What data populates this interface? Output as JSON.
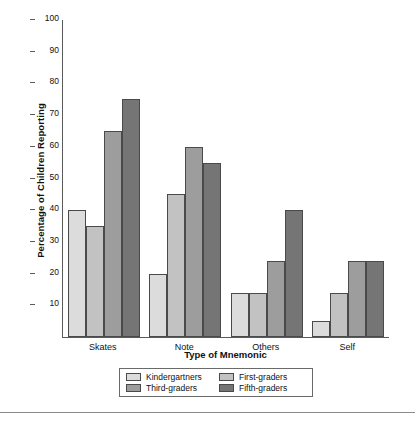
{
  "chart_data": {
    "type": "bar",
    "title": "",
    "subtitle": "",
    "xlabel": "Type of Mnemonic",
    "ylabel": "Percentage of Children Reporting",
    "categories": [
      "Skates",
      "Note",
      "Others",
      "Self"
    ],
    "series": [
      {
        "name": "Kindergartners",
        "color": "#dcdcdc",
        "values": [
          40,
          20,
          14,
          5
        ]
      },
      {
        "name": "First-graders",
        "color": "#c2c2c2",
        "values": [
          35,
          45,
          14,
          14
        ]
      },
      {
        "name": "Third-graders",
        "color": "#9d9d9d",
        "values": [
          65,
          60,
          24,
          24
        ]
      },
      {
        "name": "Fifth-graders",
        "color": "#757575",
        "values": [
          75,
          55,
          40,
          24
        ]
      }
    ],
    "ylim": [
      0,
      100
    ],
    "yticks": [
      10,
      20,
      30,
      40,
      50,
      60,
      70,
      80,
      90,
      100
    ],
    "ytick_labels": [
      "10",
      "20",
      "30",
      "40",
      "50",
      "60",
      "70",
      "80",
      "90",
      "100"
    ],
    "grid": false,
    "legend_position": "bottom",
    "axis_color": "#5a5a5a",
    "bar_edge_color": "#4a4a4a",
    "background": "#ffffff"
  },
  "legend": {
    "entries": [
      {
        "label": "Kindergartners",
        "color": "#dcdcdc"
      },
      {
        "label": "First-graders",
        "color": "#c2c2c2"
      },
      {
        "label": "Third-graders",
        "color": "#9d9d9d"
      },
      {
        "label": "Fifth-graders",
        "color": "#757575"
      }
    ]
  }
}
